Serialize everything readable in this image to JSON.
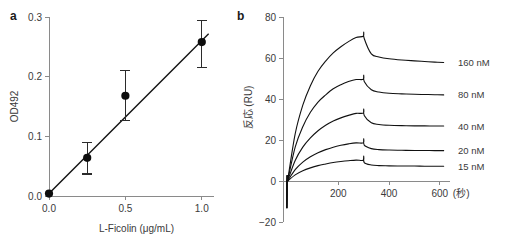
{
  "figure": {
    "panel_a_letter": "a",
    "panel_b_letter": "b"
  },
  "chart_data": [
    {
      "id": "panel_a",
      "type": "scatter",
      "title": "",
      "panel_label": "a",
      "xlabel": "L-Ficolin (μg/mL)",
      "ylabel": "OD492",
      "xlim": [
        0.0,
        1.08
      ],
      "ylim": [
        0.0,
        0.3
      ],
      "xticks": [
        0.0,
        0.5,
        1.0
      ],
      "xticklabels": [
        "0.0",
        "0.5",
        "1.0"
      ],
      "yticks": [
        0.0,
        0.1,
        0.2,
        0.3
      ],
      "yticklabels": [
        "0.0",
        "0.1",
        "0.2",
        "0.3"
      ],
      "grid": false,
      "legend": "none",
      "x": [
        0.0,
        0.25,
        0.5,
        1.0
      ],
      "y": [
        0.004,
        0.064,
        0.168,
        0.258
      ],
      "yerr_low": [
        0.004,
        0.027,
        0.042,
        0.042
      ],
      "yerr_high": [
        0.004,
        0.026,
        0.042,
        0.036
      ],
      "fit_line": {
        "x0": 0.0,
        "y0": 0.004,
        "x1": 1.045,
        "y1": 0.272
      },
      "marker": "filled-circle",
      "series_name": "L-Ficolin standard curve"
    },
    {
      "id": "panel_b",
      "type": "line",
      "title": "",
      "panel_label": "b",
      "xlabel": "(秒)",
      "ylabel": "反応 (RU)",
      "xlim": [
        -18,
        640
      ],
      "ylim": [
        -20,
        80
      ],
      "xticks": [
        200,
        400,
        600
      ],
      "xticklabels": [
        "200",
        "400",
        "600"
      ],
      "yticks": [
        -20,
        0,
        20,
        40,
        60,
        80
      ],
      "yticklabels": [
        "−20",
        "0",
        "20",
        "40",
        "60",
        "80"
      ],
      "grid": false,
      "legend": "right-inline",
      "injection_start_s": 0,
      "injection_stop_s": 300,
      "series": [
        {
          "name": "160 nM",
          "label": "160 nM",
          "r_max_at_stop": 71.0,
          "plateau_end": 57.8,
          "values": [
            0.0,
            23.0,
            37.0,
            46.5,
            53.5,
            58.5,
            62.5,
            65.5,
            68.0,
            70.0,
            71.0,
            62.0,
            60.5,
            59.6,
            59.0,
            58.6,
            58.3,
            58.0,
            57.8
          ]
        },
        {
          "name": "80 nM",
          "label": "80 nM",
          "r_max_at_stop": 50.0,
          "plateau_end": 42.0,
          "values": [
            0.0,
            16.5,
            26.5,
            33.5,
            38.5,
            42.0,
            45.0,
            47.0,
            48.5,
            49.5,
            50.0,
            44.5,
            43.4,
            42.8,
            42.5,
            42.3,
            42.2,
            42.1,
            42.0
          ]
        },
        {
          "name": "40 nM",
          "label": "40 nM",
          "r_max_at_stop": 33.5,
          "plateau_end": 26.8,
          "values": [
            0.0,
            10.0,
            16.5,
            21.0,
            24.5,
            27.2,
            29.3,
            30.8,
            32.0,
            33.0,
            33.5,
            28.4,
            27.6,
            27.2,
            27.0,
            26.9,
            26.9,
            26.8,
            26.8
          ]
        },
        {
          "name": "20 nM",
          "label": "20 nM",
          "r_max_at_stop": 19.0,
          "plateau_end": 14.8,
          "values": [
            0.0,
            5.5,
            9.2,
            11.8,
            13.8,
            15.3,
            16.5,
            17.4,
            18.1,
            18.6,
            19.0,
            15.8,
            15.3,
            15.1,
            15.0,
            14.9,
            14.9,
            14.8,
            14.8
          ]
        },
        {
          "name": "15 nM",
          "label": "15 nM",
          "r_max_at_stop": 10.5,
          "plateau_end": 7.2,
          "values": [
            0.0,
            3.0,
            5.0,
            6.4,
            7.5,
            8.3,
            9.0,
            9.5,
            9.9,
            10.2,
            10.5,
            7.8,
            7.5,
            7.4,
            7.3,
            7.3,
            7.2,
            7.2,
            7.2
          ]
        }
      ],
      "sample_times_s": [
        0,
        30,
        60,
        90,
        120,
        150,
        180,
        210,
        240,
        270,
        300,
        330,
        360,
        400,
        450,
        500,
        540,
        580,
        615
      ]
    }
  ],
  "colors": {
    "curve": "#111111",
    "axis": "#8a8a8a",
    "text": "#3a3a3a",
    "marker": "#0d0d0d",
    "background": "#ffffff"
  }
}
